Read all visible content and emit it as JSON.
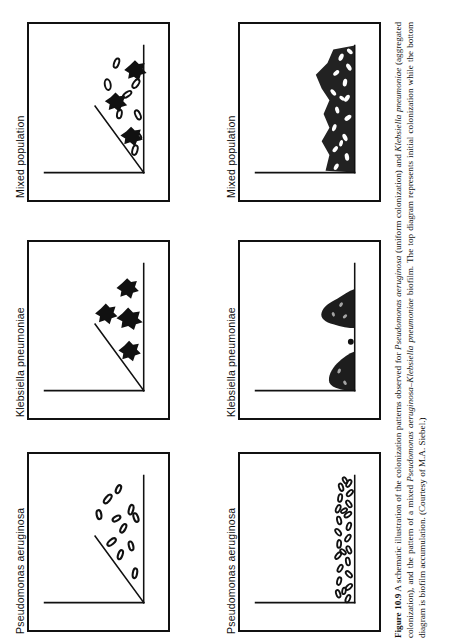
{
  "figure": {
    "number": "Figure 10.9",
    "caption_segments": [
      {
        "text": "Figure 10.9",
        "style": "bold"
      },
      {
        "text": "  A schematic illustration of the colonization patterns observed for ",
        "style": "normal"
      },
      {
        "text": "Pseudomonas aeruginosa",
        "style": "italic"
      },
      {
        "text": " (uniform colonization) and ",
        "style": "normal"
      },
      {
        "text": "Klebsiella pneumoniae",
        "style": "italic"
      },
      {
        "text": " (aggregated colonization), and the pattern of a mixed ",
        "style": "normal"
      },
      {
        "text": "Pseudomonas aeruginosa–Klebsiella pneumoniae",
        "style": "italic"
      },
      {
        "text": " biofilm. The top diagram represents initial colonization while the bottom diagram is biofilm accumulation. (Courtesy of M.A. Siebel.)",
        "style": "normal"
      }
    ],
    "caption_plain": "Figure 10.9  A schematic illustration of the colonization patterns observed for Pseudomonas aeruginosa (uniform colonization) and Klebsiella pneumoniae (aggregated colonization), and the pattern of a mixed Pseudomonas aeruginosa–Klebsiella pneumoniae biofilm. The top diagram represents initial colonization while the bottom diagram is biofilm accumulation. (Courtesy of M.A. Siebel.)"
  },
  "labels": {
    "mixed_population": "Mixed population",
    "klebsiella": "Klebsiella pneumoniae",
    "pseudomonas": "Pseudomonas aeruginosa"
  },
  "panels": [
    {
      "id": "initial-mixed",
      "organism": "Mixed population",
      "stage": "initial colonization",
      "pattern": "scattered rods and aggregates"
    },
    {
      "id": "initial-klebsiella",
      "organism": "Klebsiella pneumoniae",
      "stage": "initial colonization",
      "pattern": "sparse aggregated clusters"
    },
    {
      "id": "initial-pseudomonas",
      "organism": "Pseudomonas aeruginosa",
      "stage": "initial colonization",
      "pattern": "uniformly scattered single rods"
    },
    {
      "id": "accum-mixed",
      "organism": "Mixed population",
      "stage": "biofilm accumulation",
      "pattern": "dense mixed layer along surface"
    },
    {
      "id": "accum-klebsiella",
      "organism": "Klebsiella pneumoniae",
      "stage": "biofilm accumulation",
      "pattern": "discrete dense mounds"
    },
    {
      "id": "accum-pseudomonas",
      "organism": "Pseudomonas aeruginosa",
      "stage": "biofilm accumulation",
      "pattern": "even thin layer of rods"
    }
  ],
  "colors": {
    "ink": "#111111",
    "paper": "#ffffff"
  }
}
